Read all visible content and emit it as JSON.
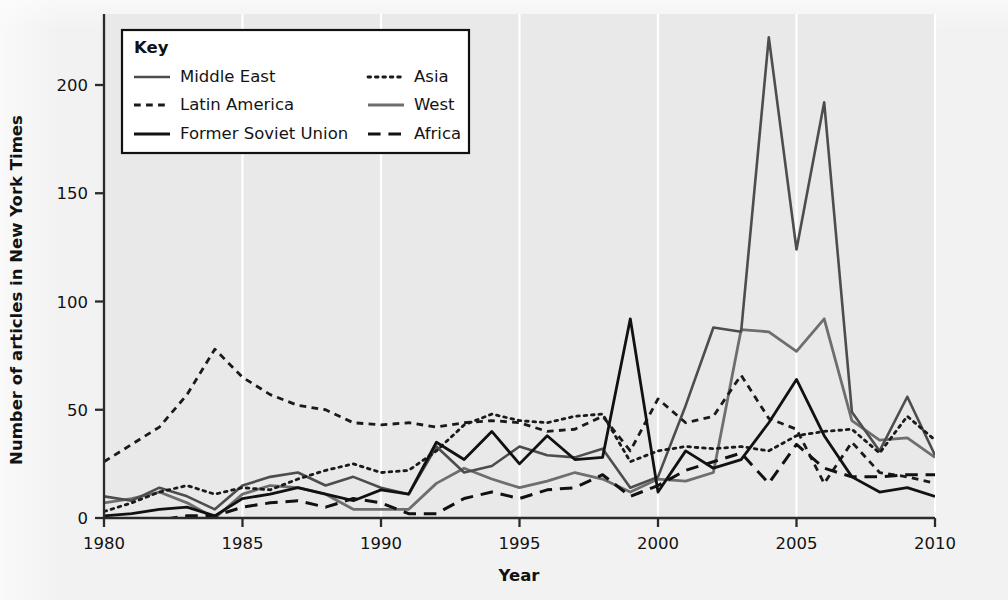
{
  "chart_data": {
    "type": "line",
    "title": "",
    "xlabel": "Year",
    "ylabel": "Number of articles in New York Times",
    "xlim": [
      1980,
      2010
    ],
    "ylim": [
      0,
      225
    ],
    "xticks": [
      1980,
      1985,
      1990,
      1995,
      2000,
      2005,
      2010
    ],
    "yticks": [
      0,
      50,
      100,
      150,
      200
    ],
    "grid": "vertical-white-major",
    "legend": {
      "title": "Key",
      "position": "top-left-inside",
      "columns": 2,
      "entries": [
        {
          "name": "Middle East",
          "style": "solid",
          "color": "#4d4d4d",
          "width": 2.6
        },
        {
          "name": "Asia",
          "style": "dotted",
          "color": "#1a1a1a",
          "width": 2.8
        },
        {
          "name": "Latin America",
          "style": "fine-dash",
          "color": "#1a1a1a",
          "width": 2.8
        },
        {
          "name": "West",
          "style": "solid",
          "color": "#6e6e6e",
          "width": 2.8
        },
        {
          "name": "Former Soviet Union",
          "style": "solid",
          "color": "#111111",
          "width": 2.8
        },
        {
          "name": "Africa",
          "style": "dash",
          "color": "#111111",
          "width": 3.0
        }
      ]
    },
    "x": [
      1980,
      1981,
      1982,
      1983,
      1984,
      1985,
      1986,
      1987,
      1988,
      1989,
      1990,
      1991,
      1992,
      1993,
      1994,
      1995,
      1996,
      1997,
      1998,
      1999,
      2000,
      2001,
      2002,
      2003,
      2004,
      2005,
      2006,
      2007,
      2008,
      2009,
      2010
    ],
    "series": [
      {
        "name": "Middle East",
        "values": [
          10,
          8,
          14,
          10,
          4,
          15,
          19,
          21,
          15,
          19,
          14,
          11,
          33,
          21,
          24,
          33,
          29,
          28,
          32,
          14,
          19,
          52,
          88,
          86,
          222,
          124,
          192,
          49,
          31,
          56,
          29
        ]
      },
      {
        "name": "Latin America",
        "values": [
          26,
          34,
          42,
          57,
          78,
          65,
          57,
          52,
          50,
          44,
          43,
          44,
          42,
          44,
          45,
          44,
          40,
          41,
          47,
          31,
          55,
          44,
          47,
          66,
          46,
          41,
          16,
          35,
          21,
          19,
          16
        ]
      },
      {
        "name": "Former Soviet Union",
        "values": [
          1,
          2,
          4,
          5,
          1,
          9,
          11,
          14,
          11,
          8,
          13,
          11,
          35,
          27,
          40,
          25,
          38,
          27,
          28,
          92,
          12,
          31,
          23,
          27,
          44,
          64,
          38,
          19,
          12,
          14,
          10
        ]
      },
      {
        "name": "Asia",
        "values": [
          3,
          7,
          12,
          15,
          11,
          14,
          13,
          18,
          22,
          25,
          21,
          22,
          31,
          43,
          48,
          45,
          44,
          47,
          48,
          26,
          31,
          33,
          32,
          33,
          31,
          38,
          40,
          41,
          30,
          47,
          36
        ]
      },
      {
        "name": "West",
        "values": [
          7,
          9,
          12,
          7,
          0,
          11,
          15,
          14,
          11,
          4,
          4,
          4,
          16,
          23,
          18,
          14,
          17,
          21,
          18,
          12,
          18,
          17,
          21,
          87,
          86,
          77,
          92,
          45,
          36,
          37,
          28
        ]
      },
      {
        "name": "Africa",
        "values": [
          0,
          -1,
          -1,
          1,
          1,
          5,
          7,
          8,
          5,
          9,
          7,
          2,
          2,
          9,
          12,
          9,
          13,
          14,
          20,
          10,
          15,
          22,
          26,
          30,
          16,
          34,
          23,
          19,
          19,
          20,
          20
        ]
      }
    ]
  }
}
